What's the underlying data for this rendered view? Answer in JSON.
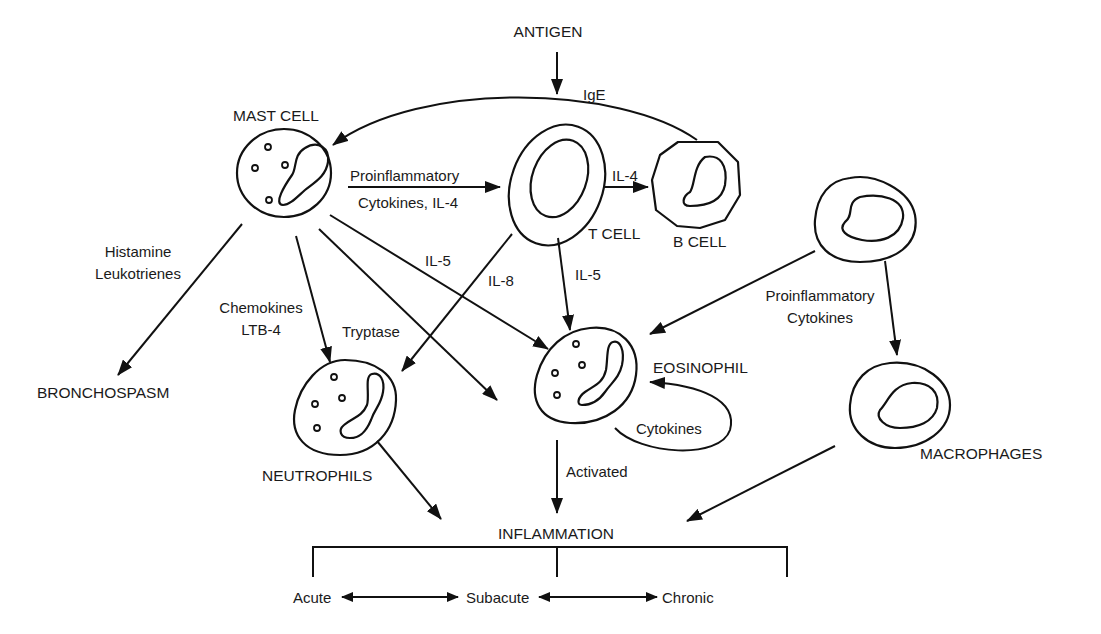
{
  "diagram": {
    "type": "immune-inflammation-pathway",
    "nodes": {
      "antigen": "ANTIGEN",
      "mast_cell": "MAST CELL",
      "t_cell": "T CELL",
      "b_cell": "B CELL",
      "eosinophil": "EOSINOPHIL",
      "neutrophils": "NEUTROPHILS",
      "macrophages": "MACROPHAGES",
      "bronchospasm": "BRONCHOSPASM",
      "inflammation": "INFLAMMATION",
      "acute": "Acute",
      "subacute": "Subacute",
      "chronic": "Chronic"
    },
    "edge_labels": {
      "ige": "IgE",
      "mast_to_t_line1": "Proinflammatory",
      "mast_to_t_line2": "Cytokines, IL-4",
      "t_to_b": "IL-4",
      "histamine": "Histamine",
      "leukotrienes": "Leukotrienes",
      "chemokines": "Chemokines",
      "ltb4": "LTB-4",
      "tryptase": "Tryptase",
      "mast_il5": "IL-5",
      "t_il8": "IL-8",
      "t_il5": "IL-5",
      "eos_cytokines": "Cytokines",
      "activated": "Activated",
      "macro_line1": "Proinflammatory",
      "macro_line2": "Cytokines"
    },
    "edges": [
      {
        "from": "ANTIGEN",
        "to": "IgE pathway",
        "label": ""
      },
      {
        "from": "B CELL",
        "to": "MAST CELL",
        "label": "IgE"
      },
      {
        "from": "MAST CELL",
        "to": "T CELL",
        "label": "Proinflammatory Cytokines, IL-4"
      },
      {
        "from": "T CELL",
        "to": "B CELL",
        "label": "IL-4"
      },
      {
        "from": "MAST CELL",
        "to": "BRONCHOSPASM",
        "label": "Histamine Leukotrienes"
      },
      {
        "from": "MAST CELL",
        "to": "NEUTROPHILS",
        "label": "Chemokines LTB-4"
      },
      {
        "from": "MAST CELL",
        "to": "(tissue)",
        "label": "Tryptase"
      },
      {
        "from": "MAST CELL",
        "to": "EOSINOPHIL",
        "label": "IL-5"
      },
      {
        "from": "T CELL",
        "to": "NEUTROPHILS",
        "label": "IL-8"
      },
      {
        "from": "T CELL",
        "to": "EOSINOPHIL",
        "label": "IL-5"
      },
      {
        "from": "Monocyte",
        "to": "EOSINOPHIL",
        "label": "Proinflammatory Cytokines"
      },
      {
        "from": "Monocyte",
        "to": "MACROPHAGES",
        "label": ""
      },
      {
        "from": "EOSINOPHIL",
        "to": "EOSINOPHIL",
        "label": "Cytokines"
      },
      {
        "from": "EOSINOPHIL",
        "to": "INFLAMMATION",
        "label": "Activated"
      },
      {
        "from": "NEUTROPHILS",
        "to": "INFLAMMATION",
        "label": ""
      },
      {
        "from": "MACROPHAGES",
        "to": "INFLAMMATION",
        "label": ""
      },
      {
        "from": "Acute",
        "to": "Subacute",
        "label": "",
        "bidirectional": true
      },
      {
        "from": "Subacute",
        "to": "Chronic",
        "label": "",
        "bidirectional": true
      }
    ],
    "colors": {
      "line": "#111111",
      "text": "#1a1a1a",
      "background": "#ffffff"
    }
  }
}
